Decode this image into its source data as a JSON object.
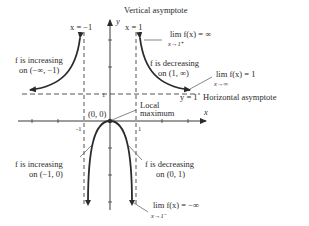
{
  "diagram": {
    "axes": {
      "x_label": "x",
      "y_label": "y",
      "x_ticks": [
        "-1",
        "1"
      ],
      "y_ticks": [
        "1"
      ]
    },
    "asymptotes": {
      "vertical_left": {
        "label": "x = −1",
        "value": -1
      },
      "vertical_right": {
        "title": "Vertical asymptote",
        "label": "x = 1",
        "value": 1
      },
      "horizontal": {
        "title": "Horizontal asymptote",
        "label": "y = 1",
        "value": 1
      }
    },
    "points": {
      "local_max": {
        "coord_label": "(0, 0)",
        "annotation_line1": "Local",
        "annotation_line2": "maximum"
      }
    },
    "annotations": {
      "inc_left_outer": {
        "line1": "f is increasing",
        "line2": "on (−∞, −1)"
      },
      "dec_right_outer": {
        "line1": "f is decreasing",
        "line2": "on (1, ∞)"
      },
      "inc_left_inner": {
        "line1": "f is increasing",
        "line2": "on (−1, 0)"
      },
      "dec_right_inner": {
        "line1": "f is decreasing",
        "line2": "on (0, 1)"
      },
      "limit_right_plus": {
        "expr": "lim f(x) = ∞",
        "sub": "x→1⁺"
      },
      "limit_infinity": {
        "expr": "lim f(x) = 1",
        "sub": "x→∞"
      },
      "limit_right_minus": {
        "expr": "lim f(x) = −∞",
        "sub": "x→1⁻"
      }
    },
    "colors": {
      "curve": "#2b2b2b",
      "axis": "#3a3a3a",
      "asymptote": "#555555"
    }
  }
}
